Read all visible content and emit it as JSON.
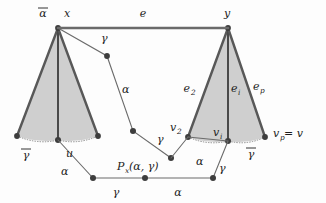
{
  "figure": {
    "type": "geometric-diagram",
    "colors": {
      "fan_fill": "#cfcfcf",
      "fan_edge": "#585858",
      "chain_edge": "#6b6b6b",
      "node": "#3d3d3d",
      "label": "#1c1c1c",
      "background": "#fdfdfd"
    }
  },
  "labels": {
    "apex_left_bar_alpha": "α",
    "apex_left_x": "x",
    "top_edge_e": "e",
    "apex_right_y": "y",
    "upper_gamma": "γ",
    "upper_alpha": "α",
    "left_base_bar_gamma": "γ",
    "left_base_u": "u",
    "left_lower_alpha": "α",
    "bottom_gamma_left": "γ",
    "bottom_alpha_right": "α",
    "mid_gamma": "γ",
    "mid_alpha_right": "α",
    "right_gamma": "γ",
    "right_base_bar_gamma": "γ",
    "p_function": "P",
    "p_subscript": "x",
    "p_args": "(α, γ)",
    "fan_edge_e2": "e",
    "fan_edge_e2_sub": "2",
    "fan_edge_ei": "e",
    "fan_edge_ei_sub": "i",
    "fan_edge_ep": "e",
    "fan_edge_ep_sub": "p",
    "vertex_v2": "v",
    "vertex_v2_sub": "2",
    "vertex_vi": "v",
    "vertex_vi_sub": "i",
    "vertex_vp_eq": "v",
    "vertex_vp_sub": "p",
    "vertex_vp_rest": " = v"
  },
  "geometry": {
    "left_fan": {
      "apex": [
        58,
        28
      ],
      "base_left": [
        17,
        136
      ],
      "base_center": [
        58,
        140
      ],
      "base_right": [
        98,
        136
      ]
    },
    "right_fan": {
      "apex": [
        228,
        28
      ],
      "base_left": [
        188,
        137
      ],
      "base_center": [
        228,
        141
      ],
      "base_right": [
        265,
        137
      ]
    },
    "top_edge": [
      [
        58,
        28
      ],
      [
        228,
        28
      ]
    ],
    "upper_chain": [
      [
        58,
        28
      ],
      [
        107,
        56
      ],
      [
        133,
        131
      ],
      [
        171,
        158
      ]
    ],
    "lower_chain": [
      [
        58,
        140
      ],
      [
        93,
        178
      ],
      [
        145,
        178
      ],
      [
        213,
        178
      ],
      [
        228,
        141
      ]
    ],
    "mid_chain": [
      [
        171,
        158
      ],
      [
        188,
        137
      ]
    ]
  }
}
